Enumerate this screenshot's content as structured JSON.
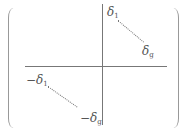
{
  "matrix": {
    "top_right": {
      "start": {
        "symbol": "δ",
        "subscript": "1"
      },
      "end": {
        "symbol": "δ",
        "subscript": "g"
      }
    },
    "bottom_left": {
      "start": {
        "symbol": "−δ",
        "subscript": "1"
      },
      "end": {
        "symbol": "−δ",
        "subscript": "g"
      }
    },
    "colors": {
      "line": "#777777",
      "text": "#555555",
      "paren": "#999999"
    }
  }
}
